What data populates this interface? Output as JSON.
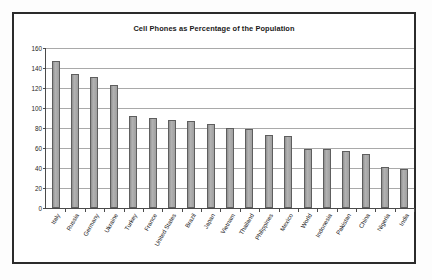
{
  "chart_data": {
    "type": "bar",
    "title": "Cell Phones as Percentage of the Population",
    "xlabel": "",
    "ylabel": "",
    "ylim": [
      0,
      160
    ],
    "ytick_step": 20,
    "yticks": [
      0,
      20,
      40,
      60,
      80,
      100,
      120,
      140,
      160
    ],
    "grid": true,
    "legend": "none",
    "orientation": "vertical",
    "bar_color": "#9d9d9d",
    "bar_border_color": "#5e5e5e",
    "categories": [
      "Italy",
      "Russia",
      "Germany",
      "Ukraine",
      "Turkey",
      "France",
      "United States",
      "Brazil",
      "Japan",
      "Vietnam",
      "Thailand",
      "Philippines",
      "Mexico",
      "World",
      "Indonesia",
      "Pakistan",
      "China",
      "Nigeria",
      "India"
    ],
    "values": [
      147,
      134,
      131,
      123,
      92,
      90,
      88,
      87,
      84,
      80,
      79,
      73,
      72,
      59,
      59,
      57,
      54,
      41,
      39
    ]
  },
  "colors": {
    "frame": "#2b2b2b",
    "axis": "#4a4a4a",
    "gridline": "#a9a9a9",
    "text": "#1a1a1a",
    "background": "#ffffff"
  }
}
